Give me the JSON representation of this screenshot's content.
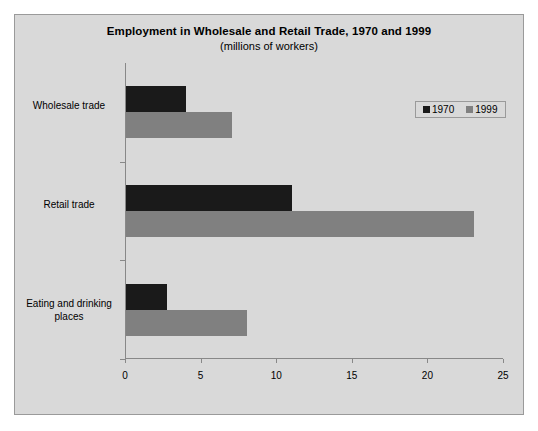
{
  "chart_data": {
    "type": "bar",
    "orientation": "horizontal",
    "title": "Employment in Wholesale and Retail Trade, 1970 and 1999",
    "subtitle": "(millions of workers)",
    "xlabel": "",
    "ylabel": "",
    "categories": [
      "Wholesale trade",
      "Retail trade",
      "Eating and drinking places"
    ],
    "series": [
      {
        "name": "1970",
        "color": "#1a1a1a",
        "values": [
          4,
          11,
          2.7
        ]
      },
      {
        "name": "1999",
        "color": "#808080",
        "values": [
          7,
          23,
          8
        ]
      }
    ],
    "xlim": [
      0,
      25
    ],
    "xticks": [
      0,
      5,
      10,
      15,
      20,
      25
    ],
    "xtick_labels": [
      "0",
      "5",
      "10",
      "15",
      "20",
      "25"
    ],
    "grid": false,
    "legend_position": "top-right"
  },
  "legend": {
    "entries": [
      {
        "label": "1970"
      },
      {
        "label": "1999"
      }
    ]
  },
  "colors": {
    "series_1970": "#1a1a1a",
    "series_1999": "#808080",
    "plot_background": "#d9d9d9",
    "axis": "#888888",
    "page_background": "#ffffff"
  }
}
